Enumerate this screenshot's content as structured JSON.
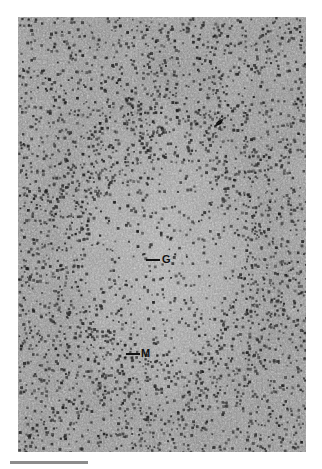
{
  "figure": {
    "type": "histology-micrograph",
    "stain": "grayscale",
    "annotations": [
      {
        "id": "G",
        "label": "G",
        "meaning": "germinal center"
      },
      {
        "id": "M",
        "label": "M",
        "meaning": "mantle zone"
      },
      {
        "id": "arrowhead",
        "label": "",
        "meaning": "arrowhead marker"
      }
    ],
    "scale_bar": {
      "label": ""
    }
  },
  "colors": {
    "background": "#ffffff",
    "tissue_base": "#8a8a8a",
    "nucleus_dark": "#2e2e2e",
    "stroma_light": "#c8c8c8",
    "label": "#111111",
    "scale_bar": "#8c8c8c"
  }
}
